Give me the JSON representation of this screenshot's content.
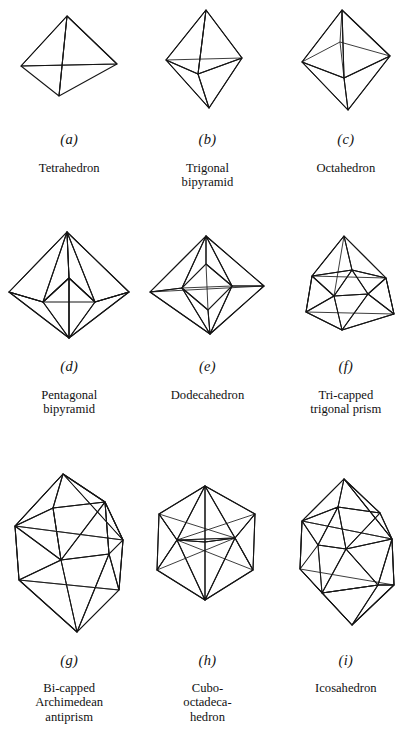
{
  "figure": {
    "caption_style": "italic-letter-in-parentheses",
    "columns": 3,
    "rows": 3,
    "colors": {
      "face_white": "#ffffff",
      "face_light_gray": "#a9a9a9",
      "face_mid_gray": "#8a8a8a",
      "face_dark_gray": "#5f5f5f",
      "face_black": "#2b2b2b",
      "edge": "#151515",
      "background": "#ffffff",
      "text": "#111111"
    },
    "items": [
      {
        "letter": "(a)",
        "name": "Tetrahedron",
        "shape_id": "tetrahedron",
        "vertices": 4,
        "faces": 4
      },
      {
        "letter": "(b)",
        "name": "Trigonal\nbipyramid",
        "shape_id": "trigonal-bipyramid",
        "vertices": 5,
        "faces": 6
      },
      {
        "letter": "(c)",
        "name": "Octahedron",
        "shape_id": "octahedron",
        "vertices": 6,
        "faces": 8
      },
      {
        "letter": "(d)",
        "name": "Pentagonal\nbipyramid",
        "shape_id": "pentagonal-bipyramid",
        "vertices": 7,
        "faces": 10
      },
      {
        "letter": "(e)",
        "name": "Dodecahedron",
        "shape_id": "dodecahedron",
        "vertices": 8,
        "faces": 12
      },
      {
        "letter": "(f)",
        "name": "Tri-capped\ntrigonal prism",
        "shape_id": "tri-capped-trigonal-prism",
        "vertices": 9,
        "faces": 14
      },
      {
        "letter": "(g)",
        "name": "Bi-capped\nArchimedean\nantiprism",
        "shape_id": "bi-capped-archimedean-antiprism",
        "vertices": 10,
        "faces": 16
      },
      {
        "letter": "(h)",
        "name": "Cubo-\noctadeca-\nhedron",
        "shape_id": "cubo-octadecahedron",
        "vertices": 12,
        "faces": 14
      },
      {
        "letter": "(i)",
        "name": "Icosahedron",
        "shape_id": "icosahedron",
        "vertices": 12,
        "faces": 20
      }
    ]
  }
}
